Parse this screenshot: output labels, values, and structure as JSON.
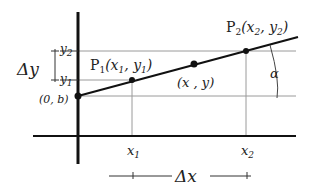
{
  "diagram": {
    "type": "linear-function-slope",
    "labels": {
      "p1": "P",
      "p1_sub": "1",
      "p1_coords_open": "(x",
      "p1_x_sub": "1",
      "p1_comma": ", y",
      "p1_y_sub": "1",
      "p1_close": ")",
      "p2": "P",
      "p2_sub": "2",
      "p2_coords_open": "(x",
      "p2_x_sub": "2",
      "p2_comma": ", y",
      "p2_y_sub": "2",
      "p2_close": ")",
      "generic_point": "(x , y)",
      "intercept": "(0, b)",
      "alpha": "α",
      "delta_y": "Δy",
      "delta_x": "Δx",
      "y1": "y",
      "y1_sub": "1",
      "y2": "y",
      "y2_sub": "2",
      "x1": "x",
      "x1_sub": "1",
      "x2": "x",
      "x2_sub": "2"
    },
    "colors": {
      "axis": "#111111",
      "line": "#111111",
      "guide": "#999999",
      "text": "#222222"
    }
  }
}
